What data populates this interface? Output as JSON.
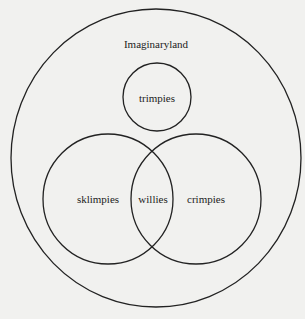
{
  "diagram": {
    "type": "euler-venn",
    "colors": {
      "background": "#f1f1ef",
      "stroke": "#222222",
      "text": "#222222"
    },
    "universe": {
      "label": "Imaginaryland"
    },
    "sets": [
      {
        "id": "trimpies",
        "label": "trimpies"
      },
      {
        "id": "sklimpies",
        "label": "sklimpies"
      },
      {
        "id": "crimpies",
        "label": "crimpies"
      }
    ],
    "intersections": [
      {
        "sets": [
          "sklimpies",
          "crimpies"
        ],
        "label": "willies"
      }
    ]
  }
}
